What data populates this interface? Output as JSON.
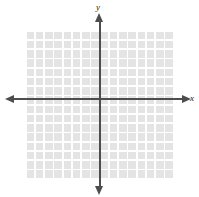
{
  "figure": {
    "kind": "cartesian-coordinate-grid",
    "width": 199,
    "height": 197,
    "background_color": "#ffffff"
  },
  "axes": {
    "x": {
      "label": "x",
      "label_style": "italic",
      "orientation": "horizontal",
      "color": "#4d4d4d",
      "arrow_left": "left-arrowhead",
      "arrow_right": "right-arrowhead",
      "tick_labels": [],
      "numbers_shown": false
    },
    "y": {
      "label": "y",
      "label_style": "italic",
      "orientation": "vertical",
      "color": "#4d4d4d",
      "arrow_top": "up-arrowhead",
      "arrow_bottom": "down-arrowhead",
      "tick_labels": [],
      "numbers_shown": false
    },
    "origin_label": ""
  },
  "grid": {
    "columns": 16,
    "rows": 16,
    "cell_size_px": 9.25,
    "cell_color": "#e4e4e4",
    "line_color": "#ffffff",
    "x_range": [
      -8,
      8
    ],
    "y_range": [
      -8,
      8
    ],
    "visible": true
  },
  "chart_data": {
    "type": "scatter",
    "title": "",
    "subtitle": "",
    "xlabel": "x",
    "ylabel": "y",
    "xlim": [
      -8,
      8
    ],
    "ylim": [
      -8,
      8
    ],
    "xticks": [],
    "yticks": [],
    "grid": true,
    "legend": null,
    "series": [],
    "annotations": [],
    "note": "Empty blank coordinate plane: 16 by 16 shaded grid squares with white separator lines, x- and y-axes drawn through the center with arrowheads at all four ends, italic axis labels x and y, and no plotted data points or tick numbers."
  }
}
